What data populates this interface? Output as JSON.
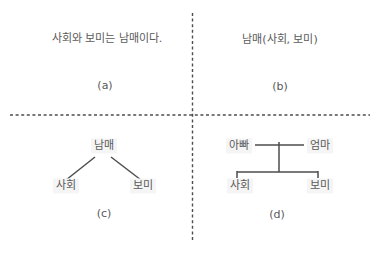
{
  "figure": {
    "description_type": "four-panel sibling-relationship representations",
    "quadrants": {
      "a": {
        "text": "사회와 보미는 남매이다.",
        "label": "(a)"
      },
      "b": {
        "text": "남매(사회, 보미)",
        "label": "(b)"
      },
      "c": {
        "type": "tree",
        "root": "남매",
        "children": [
          "사회",
          "보미"
        ],
        "label": "(c)"
      },
      "d": {
        "type": "family-tree",
        "parents": [
          "아빠",
          "엄마"
        ],
        "children": [
          "사회",
          "보미"
        ],
        "label": "(d)"
      }
    },
    "divider_style": "dashed",
    "colors": {
      "text": "#595959",
      "line": "#4d4d4d",
      "divider": "#4d4d4d",
      "background": "#ffffff",
      "node_bg": "#f5f5f5"
    }
  }
}
